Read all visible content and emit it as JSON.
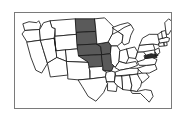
{
  "figure": {
    "type": "choropleth-map",
    "title": "",
    "frame_border_color": "#7a7a7a",
    "background_color": "#ffffff"
  },
  "map": {
    "region": "United States",
    "outline_color": "#1a1a1a",
    "default_fill": "#ffffff",
    "highlight_fill": "#5a5a5a",
    "accent_fill": "#2b2b2b",
    "legend": [],
    "highlighted_states": [
      "North Dakota",
      "South Dakota",
      "Nebraska",
      "Kansas",
      "Iowa",
      "Missouri"
    ],
    "accent_states": [
      "Maryland",
      "Delaware"
    ],
    "states": [
      {
        "code": "WA",
        "name": "Washington",
        "highlighted": false
      },
      {
        "code": "OR",
        "name": "Oregon",
        "highlighted": false
      },
      {
        "code": "CA",
        "name": "California",
        "highlighted": false
      },
      {
        "code": "NV",
        "name": "Nevada",
        "highlighted": false
      },
      {
        "code": "ID",
        "name": "Idaho",
        "highlighted": false
      },
      {
        "code": "MT",
        "name": "Montana",
        "highlighted": false
      },
      {
        "code": "WY",
        "name": "Wyoming",
        "highlighted": false
      },
      {
        "code": "UT",
        "name": "Utah",
        "highlighted": false
      },
      {
        "code": "AZ",
        "name": "Arizona",
        "highlighted": false
      },
      {
        "code": "CO",
        "name": "Colorado",
        "highlighted": false
      },
      {
        "code": "NM",
        "name": "New Mexico",
        "highlighted": false
      },
      {
        "code": "ND",
        "name": "North Dakota",
        "highlighted": true
      },
      {
        "code": "SD",
        "name": "South Dakota",
        "highlighted": true
      },
      {
        "code": "NE",
        "name": "Nebraska",
        "highlighted": true
      },
      {
        "code": "KS",
        "name": "Kansas",
        "highlighted": true
      },
      {
        "code": "OK",
        "name": "Oklahoma",
        "highlighted": false
      },
      {
        "code": "TX",
        "name": "Texas",
        "highlighted": false
      },
      {
        "code": "MN",
        "name": "Minnesota",
        "highlighted": false
      },
      {
        "code": "IA",
        "name": "Iowa",
        "highlighted": true
      },
      {
        "code": "MO",
        "name": "Missouri",
        "highlighted": true
      },
      {
        "code": "AR",
        "name": "Arkansas",
        "highlighted": false
      },
      {
        "code": "LA",
        "name": "Louisiana",
        "highlighted": false
      },
      {
        "code": "WI",
        "name": "Wisconsin",
        "highlighted": false
      },
      {
        "code": "IL",
        "name": "Illinois",
        "highlighted": false
      },
      {
        "code": "MI",
        "name": "Michigan",
        "highlighted": false
      },
      {
        "code": "IN",
        "name": "Indiana",
        "highlighted": false
      },
      {
        "code": "OH",
        "name": "Ohio",
        "highlighted": false
      },
      {
        "code": "KY",
        "name": "Kentucky",
        "highlighted": false
      },
      {
        "code": "TN",
        "name": "Tennessee",
        "highlighted": false
      },
      {
        "code": "MS",
        "name": "Mississippi",
        "highlighted": false
      },
      {
        "code": "AL",
        "name": "Alabama",
        "highlighted": false
      },
      {
        "code": "GA",
        "name": "Georgia",
        "highlighted": false
      },
      {
        "code": "FL",
        "name": "Florida",
        "highlighted": false
      },
      {
        "code": "SC",
        "name": "South Carolina",
        "highlighted": false
      },
      {
        "code": "NC",
        "name": "North Carolina",
        "highlighted": false
      },
      {
        "code": "VA",
        "name": "Virginia",
        "highlighted": false
      },
      {
        "code": "WV",
        "name": "West Virginia",
        "highlighted": false
      },
      {
        "code": "MD",
        "name": "Maryland",
        "highlighted": false
      },
      {
        "code": "DE",
        "name": "Delaware",
        "highlighted": false
      },
      {
        "code": "PA",
        "name": "Pennsylvania",
        "highlighted": false
      },
      {
        "code": "NJ",
        "name": "New Jersey",
        "highlighted": false
      },
      {
        "code": "NY",
        "name": "New York",
        "highlighted": false
      },
      {
        "code": "CT",
        "name": "Connecticut",
        "highlighted": false
      },
      {
        "code": "RI",
        "name": "Rhode Island",
        "highlighted": false
      },
      {
        "code": "MA",
        "name": "Massachusetts",
        "highlighted": false
      },
      {
        "code": "VT",
        "name": "Vermont",
        "highlighted": false
      },
      {
        "code": "NH",
        "name": "New Hampshire",
        "highlighted": false
      },
      {
        "code": "ME",
        "name": "Maine",
        "highlighted": false
      }
    ]
  }
}
